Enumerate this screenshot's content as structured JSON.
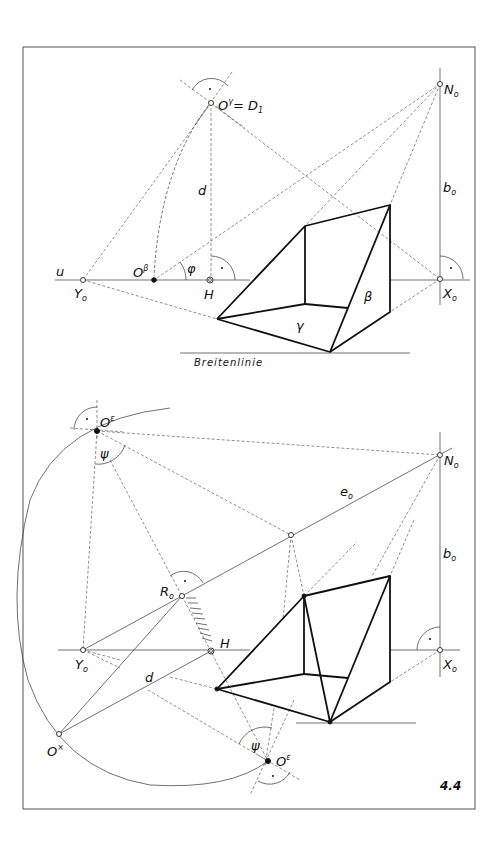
{
  "figure": {
    "number": "4.4",
    "frame": {
      "x": 23,
      "y": 47,
      "width": 452,
      "height": 762
    }
  },
  "top_panel": {
    "labels": {
      "u": "u",
      "O_gamma": "O",
      "O_gamma_sup": "γ",
      "O_gamma_eq": "= D",
      "O_gamma_sub": "1",
      "N0": "N",
      "N0_sub": "o",
      "b0": "b",
      "b0_sub": "o",
      "d": "d",
      "O_beta": "O",
      "O_beta_sup": "β",
      "phi": "φ",
      "H": "H",
      "Y0": "Y",
      "Y0_sub": "o",
      "X0": "X",
      "X0_sub": "o",
      "gamma": "γ",
      "beta": "β",
      "breitenlinie": "Breitenlinie"
    },
    "points": {
      "N0": [
        440,
        84
      ],
      "X0": [
        440,
        279
      ],
      "Y0": [
        83,
        280
      ],
      "H": [
        210,
        280
      ],
      "O_gamma": [
        211,
        103
      ],
      "O_beta": [
        154,
        280
      ]
    },
    "prism": {
      "A": [
        217,
        319
      ],
      "B": [
        305,
        226
      ],
      "C": [
        390,
        205
      ],
      "D": [
        330,
        352
      ],
      "E": [
        305,
        304
      ],
      "F": [
        390,
        312
      ],
      "G": [
        348,
        308
      ]
    }
  },
  "bottom_panel": {
    "labels": {
      "O_eps_top": "O",
      "O_eps_top_sup": "ε",
      "psi_top": "ψ",
      "N0": "N",
      "N0_sub": "o",
      "e0": "e",
      "e0_sub": "o",
      "b0": "b",
      "b0_sub": "o",
      "R0": "R",
      "R0_sub": "o",
      "H": "H",
      "Y0": "Y",
      "Y0_sub": "o",
      "X0": "X",
      "X0_sub": "o",
      "d": "d",
      "O_x": "O",
      "O_x_sup": "×",
      "psi_bottom": "ψ",
      "O_eps_bottom": "O",
      "O_eps_bottom_sup": "ε"
    },
    "points": {
      "O_eps_top": [
        97,
        431
      ],
      "N0": [
        440,
        455
      ],
      "X0": [
        440,
        650
      ],
      "Y0": [
        83,
        650
      ],
      "H": [
        211,
        651
      ],
      "R0": [
        182,
        596
      ],
      "O_x": [
        59,
        734
      ],
      "O_eps_bottom": [
        268,
        761
      ],
      "e0_mid": [
        291,
        535
      ]
    },
    "prism": {
      "A": [
        217,
        689
      ],
      "B": [
        304,
        596
      ],
      "C": [
        390,
        576
      ],
      "D": [
        330,
        722
      ],
      "E": [
        304,
        674
      ],
      "F": [
        390,
        682
      ],
      "G": [
        348,
        678
      ]
    }
  }
}
